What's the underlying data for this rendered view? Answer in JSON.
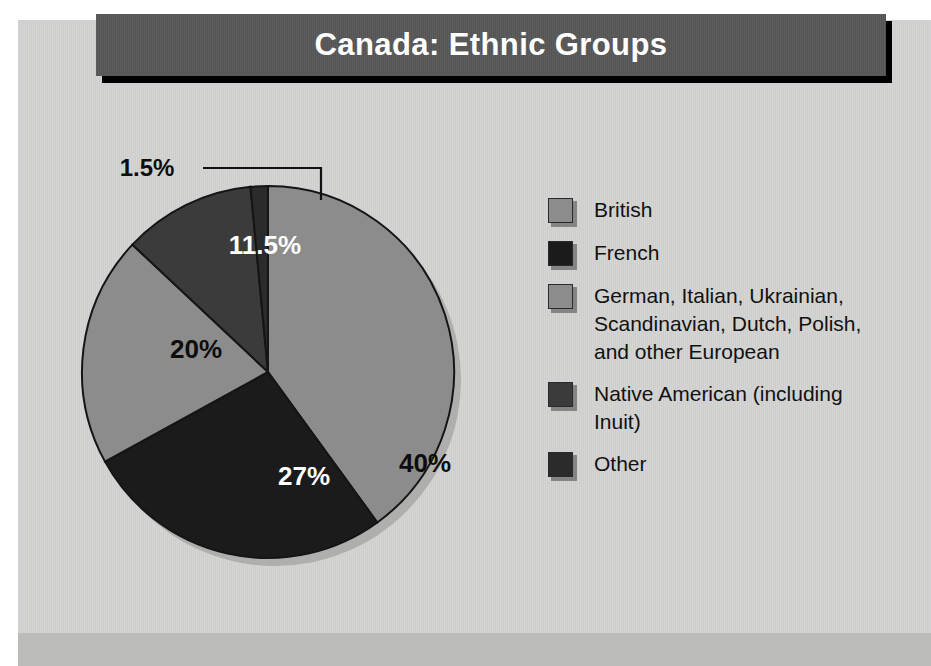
{
  "title": {
    "text": "Canada: Ethnic Groups",
    "band_color": "#575757",
    "text_color": "#ffffff"
  },
  "page": {
    "background": "#ffffff",
    "panel_color": "#d2d3d1",
    "bottom_band_color": "#bcbdbb"
  },
  "chart_data": {
    "type": "pie",
    "title": "Canada: Ethnic Groups",
    "xlabel": "",
    "ylabel": "",
    "legend_position": "right",
    "grid": false,
    "start_angle_deg": 0,
    "direction": "clockwise",
    "categories": [
      "British",
      "French",
      "German, Italian, Ukrainian, Scandinavian, Dutch, Polish, and other European",
      "Native American (including Inuit)",
      "Other"
    ],
    "values": [
      40,
      27,
      20,
      11.5,
      1.5
    ],
    "value_labels": [
      "40%",
      "27%",
      "20%",
      "11.5%",
      "1.5%"
    ],
    "colors": [
      "#8c8c8c",
      "#1b1b1b",
      "#8c8c8c",
      "#3b3b3b",
      "#2b2b2b"
    ],
    "label_text_colors": [
      "#0d0d0d",
      "#ffffff",
      "#0d0d0d",
      "#ffffff",
      "#0d0d0d"
    ],
    "callout_slices": [
      "Other"
    ]
  },
  "slices": [
    {
      "name": "British",
      "percent_label": "40%",
      "value": 40,
      "color": "#8c8c8c",
      "label_color": "#0d0d0d",
      "label_x": 370,
      "label_y": 342
    },
    {
      "name": "French",
      "percent_label": "27%",
      "value": 27,
      "color": "#1b1b1b",
      "label_color": "#ffffff",
      "label_x": 249,
      "label_y": 355
    },
    {
      "name": "German et al.",
      "percent_label": "20%",
      "value": 20,
      "color": "#8c8c8c",
      "label_color": "#0d0d0d",
      "label_x": 141,
      "label_y": 228
    },
    {
      "name": "Native American",
      "percent_label": "11.5%",
      "value": 11.5,
      "color": "#3b3b3b",
      "label_color": "#ffffff",
      "label_x": 210,
      "label_y": 124
    },
    {
      "name": "Other",
      "percent_label": "1.5%",
      "value": 1.5,
      "color": "#2b2b2b",
      "label_color": "#0d0d0d",
      "label_x": 92,
      "label_y": 34
    }
  ],
  "legend": {
    "items": [
      {
        "label": "British",
        "color": "#8c8c8c"
      },
      {
        "label": "French",
        "color": "#1b1b1b"
      },
      {
        "label": "German, Italian, Ukrainian, Scandinavian, Dutch, Polish, and other European",
        "color": "#8c8c8c"
      },
      {
        "label": "Native American (including Inuit)",
        "color": "#3b3b3b"
      },
      {
        "label": "Other",
        "color": "#2b2b2b"
      }
    ]
  }
}
